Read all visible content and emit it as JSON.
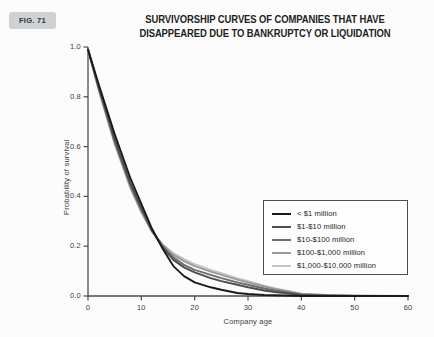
{
  "figure": {
    "badge_label": "FIG. 71"
  },
  "title": {
    "line1": "SURVIVORSHIP CURVES OF COMPANIES THAT HAVE",
    "line2": "DISAPPEARED DUE TO BANKRUPTCY OR LIQUIDATION"
  },
  "axes": {
    "x_title": "Company age",
    "y_title": "Probability of survival",
    "x_ticks": [
      "0",
      "10",
      "20",
      "30",
      "40",
      "50",
      "60"
    ],
    "y_ticks": [
      "0.0",
      "0.2",
      "0.4",
      "0.6",
      "0.8",
      "1.0"
    ]
  },
  "legend": {
    "items": [
      {
        "label": "< $1 million",
        "color": "#1a1a1a"
      },
      {
        "label": "$1-$10 million",
        "color": "#4d4d4d"
      },
      {
        "label": "$10-$100 million",
        "color": "#6e6e6e"
      },
      {
        "label": "$100-$1,000 million",
        "color": "#9a9a9a"
      },
      {
        "label": "$1,000-$10,000 million",
        "color": "#c4c4c4"
      }
    ]
  },
  "chart_data": {
    "type": "line",
    "title": "SURVIVORSHIP CURVES OF COMPANIES THAT HAVE DISAPPEARED DUE TO BANKRUPTCY OR LIQUIDATION",
    "xlabel": "Company age",
    "ylabel": "Probability of survival",
    "xlim": [
      0,
      60
    ],
    "ylim": [
      0.0,
      1.0
    ],
    "xticks": [
      0,
      10,
      20,
      30,
      40,
      50,
      60
    ],
    "yticks": [
      0.0,
      0.2,
      0.4,
      0.6,
      0.8,
      1.0
    ],
    "grid": false,
    "legend_position": "center-right",
    "x": [
      0,
      2,
      5,
      8,
      10,
      12,
      14,
      16,
      18,
      20,
      23,
      25,
      28,
      30,
      33,
      35,
      40,
      45,
      50,
      55,
      60
    ],
    "series": [
      {
        "name": "< $1 million",
        "color": "#1a1a1a",
        "values": [
          0.99,
          0.85,
          0.65,
          0.47,
          0.37,
          0.27,
          0.19,
          0.12,
          0.08,
          0.055,
          0.035,
          0.025,
          0.012,
          0.008,
          0.004,
          0.003,
          0.0,
          0.0,
          0.0,
          0.0,
          0.0
        ]
      },
      {
        "name": "$1-$10 million",
        "color": "#4d4d4d",
        "values": [
          0.99,
          0.84,
          0.63,
          0.45,
          0.355,
          0.265,
          0.195,
          0.145,
          0.115,
          0.095,
          0.072,
          0.06,
          0.045,
          0.035,
          0.022,
          0.016,
          0.004,
          0.001,
          0.0,
          0.0,
          0.0
        ]
      },
      {
        "name": "$10-$100 million",
        "color": "#6e6e6e",
        "values": [
          0.99,
          0.835,
          0.62,
          0.44,
          0.345,
          0.26,
          0.2,
          0.155,
          0.125,
          0.105,
          0.085,
          0.072,
          0.055,
          0.045,
          0.03,
          0.022,
          0.006,
          0.002,
          0.0,
          0.0,
          0.0
        ]
      },
      {
        "name": "$100-$1,000 million",
        "color": "#9a9a9a",
        "values": [
          0.99,
          0.83,
          0.615,
          0.435,
          0.34,
          0.26,
          0.205,
          0.165,
          0.14,
          0.12,
          0.098,
          0.085,
          0.066,
          0.055,
          0.038,
          0.028,
          0.008,
          0.003,
          0.001,
          0.0,
          0.0
        ]
      },
      {
        "name": "$1,000-$10,000 million",
        "color": "#c4c4c4",
        "values": [
          0.99,
          0.825,
          0.61,
          0.43,
          0.335,
          0.258,
          0.208,
          0.172,
          0.148,
          0.128,
          0.105,
          0.092,
          0.072,
          0.06,
          0.042,
          0.031,
          0.009,
          0.004,
          0.002,
          0.001,
          0.0
        ]
      }
    ]
  }
}
